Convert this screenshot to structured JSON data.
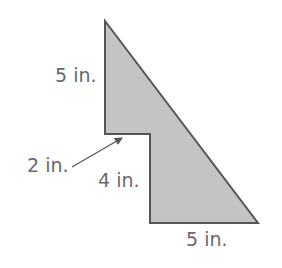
{
  "diagram": {
    "type": "composite-figure",
    "colors": {
      "fill": "#c4c4c4",
      "stroke": "#555555",
      "label": "#6a6a6a",
      "arrow": "#555555"
    },
    "shape_vertices": [
      [
        105,
        21
      ],
      [
        258,
        223
      ],
      [
        150,
        223
      ],
      [
        150,
        134
      ],
      [
        105,
        134
      ]
    ],
    "labels": {
      "left_top_side": "5 in.",
      "step_width": "2 in.",
      "step_height": "4 in.",
      "bottom_side": "5 in."
    }
  }
}
